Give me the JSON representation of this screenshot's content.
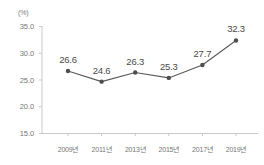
{
  "chart_data": {
    "type": "line",
    "title": "",
    "subtitle": "",
    "xlabel": "",
    "ylabel": "",
    "unit_label": "(%)",
    "categories": [
      "2009년",
      "2011년",
      "2013년",
      "2015년",
      "2017년",
      "2019년"
    ],
    "values": [
      26.6,
      24.6,
      26.3,
      25.3,
      27.7,
      32.3
    ],
    "point_labels": [
      "26.6",
      "24.6",
      "26.3",
      "25.3",
      "27.7",
      "32.3"
    ],
    "ylim": [
      15.0,
      35.0
    ],
    "y_ticks": [
      35.0,
      30.0,
      25.0,
      20.0,
      15.0
    ],
    "y_tick_labels": [
      "35.0",
      "30.0",
      "25.0",
      "20.0",
      "15.0"
    ],
    "grid": false,
    "legend": null,
    "legend_position": "none",
    "marker": "circle",
    "colors": {
      "line": "#5a5a5a",
      "marker": "#4d4d4d",
      "axis": "#c9c9c9",
      "tick_text": "#767676",
      "label_text": "#4a4a4a",
      "background": "#ffffff"
    }
  }
}
